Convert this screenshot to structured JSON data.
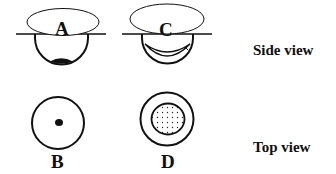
{
  "figures": {
    "A": {
      "label": "A",
      "view": "side",
      "description": "cup with small dark deposit at bottom"
    },
    "B": {
      "label": "B",
      "view": "top",
      "description": "circle with small central dot"
    },
    "C": {
      "label": "C",
      "view": "side",
      "description": "cup with crescent-shaped layer lining the bottom"
    },
    "D": {
      "label": "D",
      "view": "top",
      "description": "circle with large stippled central disc"
    }
  },
  "row_labels": {
    "side": "Side view",
    "top": "Top view"
  },
  "colors": {
    "stroke": "#111111",
    "background": "#ffffff"
  }
}
